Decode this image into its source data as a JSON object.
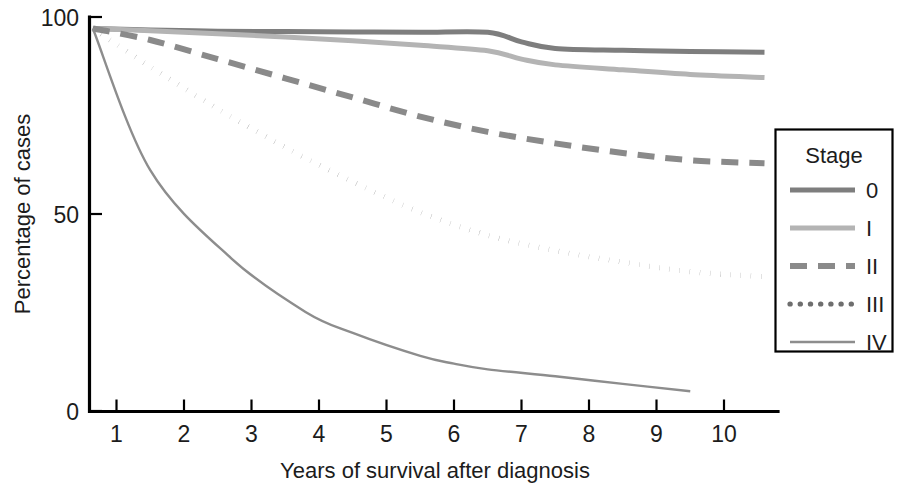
{
  "chart_data": {
    "type": "line",
    "title": "",
    "xlabel": "Years of survival after diagnosis",
    "ylabel": "Percentage of cases",
    "xlim": [
      0.6,
      10.8
    ],
    "ylim": [
      0,
      103
    ],
    "x_ticks": [
      1,
      2,
      3,
      4,
      5,
      6,
      7,
      8,
      9,
      10
    ],
    "x_tick_labels": [
      "1",
      "2",
      "3",
      "4",
      "5",
      "6",
      "7",
      "8",
      "9",
      "10"
    ],
    "y_ticks": [
      0,
      50,
      100
    ],
    "y_tick_labels": [
      "0",
      "50",
      "100"
    ],
    "grid": false,
    "legend_position": "right",
    "legend_title": "Stage",
    "series": [
      {
        "name": "0",
        "legend_label": "0",
        "color": "#7e7e7e",
        "style": "solid",
        "width": 5.0,
        "x": [
          0.65,
          1.5,
          2.5,
          3.5,
          4.5,
          5.5,
          6.5,
          7.0,
          7.5,
          8.5,
          9.5,
          10.6
        ],
        "y": [
          100,
          99.6,
          99.3,
          99.2,
          99.1,
          99.0,
          99.0,
          96.5,
          94.8,
          94.3,
          94.0,
          93.8
        ]
      },
      {
        "name": "I",
        "legend_label": "I",
        "color": "#b4b4b4",
        "style": "solid",
        "width": 5.0,
        "x": [
          0.65,
          1.5,
          2.5,
          3.5,
          4.5,
          5.5,
          6.5,
          7.0,
          7.5,
          8.5,
          9.5,
          10.6
        ],
        "y": [
          100,
          99.4,
          98.6,
          97.8,
          96.8,
          95.6,
          94.2,
          92.0,
          90.5,
          89.2,
          88.0,
          87.2
        ]
      },
      {
        "name": "II",
        "legend_label": "II",
        "color": "#8a8a8a",
        "style": "dashed",
        "width": 6.0,
        "dash": "17 11",
        "x": [
          0.65,
          1.5,
          2.5,
          3.5,
          4.5,
          5.5,
          6.5,
          7.5,
          8.5,
          9.5,
          10.6
        ],
        "y": [
          100,
          97.0,
          92.0,
          87.0,
          82.0,
          77.0,
          73.0,
          70.0,
          67.5,
          65.6,
          64.8
        ]
      },
      {
        "name": "III",
        "legend_label": "III",
        "color": "#6e6e6e",
        "style": "dotted",
        "width": 5.2,
        "dash": "0.2 10",
        "x": [
          0.65,
          1.5,
          2.5,
          3.5,
          4.5,
          5.5,
          6.5,
          7.5,
          8.5,
          9.5,
          10.6
        ],
        "y": [
          100,
          90.0,
          79.0,
          69.0,
          60.0,
          52.0,
          46.0,
          42.0,
          39.0,
          36.5,
          35.2
        ]
      },
      {
        "name": "IV",
        "legend_label": "IV",
        "color": "#8d8d8d",
        "style": "solid",
        "width": 2.4,
        "x": [
          0.65,
          1.5,
          2.7,
          3.8,
          4.5,
          5.5,
          6.0,
          6.5,
          7.5,
          8.5,
          9.5
        ],
        "y": [
          100,
          63.0,
          40.0,
          26.0,
          20.5,
          14.5,
          12.5,
          11.0,
          9.2,
          7.2,
          5.3
        ]
      }
    ]
  },
  "axis": {
    "y_label": "Percentage of cases",
    "x_label": "Years of survival after diagnosis",
    "y_tick_0": "0",
    "y_tick_50": "50",
    "y_tick_100": "100"
  },
  "legend": {
    "title": "Stage",
    "items": [
      {
        "label": "0"
      },
      {
        "label": "I"
      },
      {
        "label": "II"
      },
      {
        "label": "III"
      },
      {
        "label": "IV"
      }
    ]
  }
}
